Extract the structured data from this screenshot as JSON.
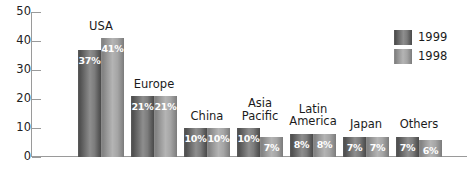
{
  "chart_data": {
    "type": "bar",
    "title": "",
    "xlabel": "",
    "ylabel": "",
    "ylim": [
      0,
      50
    ],
    "yticks": [
      "0",
      "10",
      "20",
      "30",
      "40",
      "50"
    ],
    "grid": false,
    "legend_position": "top-right",
    "categories": [
      "USA",
      "Europe",
      "China",
      "Asia\nPacific",
      "Latin\nAmerica",
      "Japan",
      "Others"
    ],
    "series": [
      {
        "name": "1999",
        "color": "#5c5c5c",
        "values": [
          37,
          21,
          10,
          10,
          8,
          7,
          7
        ],
        "labels": [
          "37%",
          "21%",
          "10%",
          "10%",
          "8%",
          "7%",
          "7%"
        ]
      },
      {
        "name": "1998",
        "color": "#9b9b9b",
        "values": [
          41,
          21,
          10,
          7,
          8,
          7,
          6
        ],
        "labels": [
          "41%",
          "21%",
          "10%",
          "7%",
          "8%",
          "7%",
          "6%"
        ]
      }
    ]
  },
  "legend": {
    "items": [
      {
        "label": "1999",
        "color": "#5c5c5c"
      },
      {
        "label": "1998",
        "color": "#9b9b9b"
      }
    ]
  }
}
